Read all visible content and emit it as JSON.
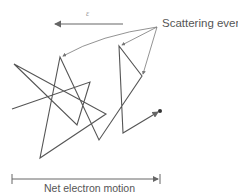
{
  "diagram": {
    "field_label": "ε",
    "scattering_label": "Scattering events",
    "net_motion_label": "Net electron motion",
    "path_points": [
      [
        12,
        109
      ],
      [
        90,
        82
      ],
      [
        77,
        125
      ],
      [
        14,
        64
      ],
      [
        106,
        114
      ],
      [
        40,
        158
      ],
      [
        60,
        57
      ],
      [
        99,
        140
      ],
      [
        142,
        76
      ],
      [
        119,
        46
      ],
      [
        123,
        133
      ],
      [
        160,
        111
      ]
    ],
    "field_arrow": {
      "from": [
        123,
        24
      ],
      "to": [
        53,
        24
      ]
    },
    "callout_origin": [
      157,
      27
    ],
    "callout_targets": [
      [
        61,
        57
      ],
      [
        121,
        46
      ],
      [
        142,
        76
      ]
    ],
    "net_bar": {
      "x1": 12,
      "x2": 160,
      "y": 179
    },
    "colors": {
      "line": "#555555",
      "text": "#555555"
    }
  }
}
